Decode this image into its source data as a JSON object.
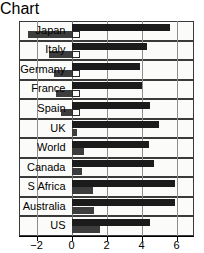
{
  "chart_data": {
    "type": "bar",
    "orientation": "horizontal",
    "title": "",
    "subtitle": "",
    "xlabel": "",
    "ylabel": "",
    "xlim": [
      -3,
      7
    ],
    "xticks": [
      -2,
      0,
      2,
      4,
      6
    ],
    "xtick_labels": [
      "−2",
      "0",
      "2",
      "4",
      "6"
    ],
    "grid": true,
    "legend": "none",
    "categories": [
      "Japan",
      "Italy",
      "Germany",
      "France",
      "Spain",
      "UK",
      "World",
      "Canada",
      "S Africa",
      "Australia",
      "US"
    ],
    "series": [
      {
        "name": "Series 1",
        "color": "#1b1b1b",
        "values": [
          5.6,
          4.3,
          3.9,
          4.0,
          4.5,
          5.0,
          4.4,
          4.7,
          5.9,
          5.9,
          4.5
        ]
      },
      {
        "name": "Series 2",
        "color": "#3d3d3d",
        "values": [
          -2.5,
          -1.3,
          -1.0,
          -0.9,
          -0.6,
          0.3,
          0.7,
          0.6,
          1.2,
          1.3,
          1.6
        ]
      }
    ]
  },
  "axis": {
    "zero_label": "0",
    "ticks": [
      {
        "label": "−2",
        "value": -2
      },
      {
        "label": "0",
        "value": 0
      },
      {
        "label": "2",
        "value": 2
      },
      {
        "label": "4",
        "value": 4
      },
      {
        "label": "6",
        "value": 6
      }
    ]
  }
}
